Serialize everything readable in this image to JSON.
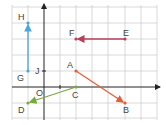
{
  "diagram": {
    "type": "coordinate-grid-vectors",
    "origin_label": "O",
    "grid_unit_px": 16,
    "origin_px": [
      44,
      87
    ],
    "points": [
      {
        "label": "A",
        "coord": [
          2,
          1
        ]
      },
      {
        "label": "B",
        "coord": [
          5,
          -1
        ]
      },
      {
        "label": "C",
        "coord": [
          2,
          0
        ]
      },
      {
        "label": "D",
        "coord": [
          -1,
          -1
        ]
      },
      {
        "label": "E",
        "coord": [
          5,
          3
        ]
      },
      {
        "label": "F",
        "coord": [
          2,
          3
        ]
      },
      {
        "label": "G",
        "coord": [
          -1,
          1
        ]
      },
      {
        "label": "H",
        "coord": [
          -1,
          4
        ]
      },
      {
        "label": "J",
        "coord": [
          0,
          1
        ]
      }
    ],
    "vectors": [
      {
        "from": "A",
        "to": "B",
        "color": "#e0603a"
      },
      {
        "from": "C",
        "to": "D",
        "color": "#7aaa3a"
      },
      {
        "from": "E",
        "to": "F",
        "color": "#b8405a"
      },
      {
        "from": "G",
        "to": "H",
        "color": "#4aa8d8"
      }
    ],
    "labels": {
      "A": "A",
      "B": "B",
      "C": "C",
      "D": "D",
      "E": "E",
      "F": "F",
      "G": "G",
      "H": "H",
      "J": "J",
      "O": "O"
    }
  }
}
